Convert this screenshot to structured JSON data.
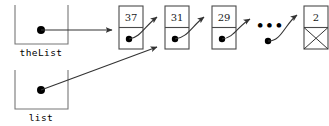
{
  "diagram": {
    "background_color": "#ffffff",
    "variables": [
      {
        "id": "theList",
        "label": "theList",
        "points_to": "node-37"
      },
      {
        "id": "list",
        "label": "list",
        "points_to": "node-31"
      }
    ],
    "nodes": [
      {
        "id": "node-37",
        "value": "37",
        "next": "node-31",
        "null_terminated": false
      },
      {
        "id": "node-31",
        "value": "31",
        "next": "node-29",
        "null_terminated": false
      },
      {
        "id": "node-29",
        "value": "29",
        "next": "ellipsis",
        "null_terminated": false
      },
      {
        "id": "node-2",
        "value": "2",
        "next": null,
        "null_terminated": true
      }
    ],
    "ellipsis": {
      "id": "ellipsis",
      "label": "•••",
      "dot_count": 3
    },
    "colors": {
      "stroke": "#4a4a4a",
      "variable_box_stroke": "#777777",
      "arrow": "#333333",
      "dot": "#000000",
      "text": "#1a1a1a",
      "background": "#ffffff"
    }
  }
}
